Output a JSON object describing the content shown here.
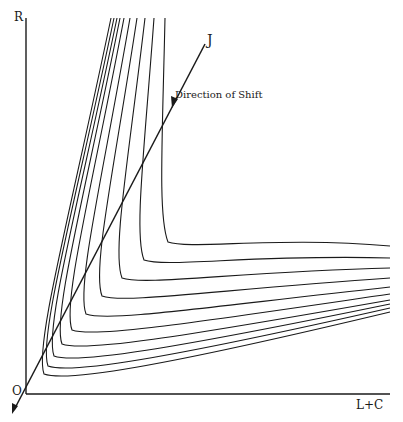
{
  "diagram": {
    "axes": {
      "y_label": "R",
      "x_label": "L+C",
      "origin_label": "O"
    },
    "line": {
      "label": "J",
      "annotation": "Direction of Shift"
    },
    "colors": {
      "ink": "#1a1a1a",
      "background": "#ffffff"
    },
    "curves": [
      {
        "top_x": 111,
        "vertex_x": 36,
        "vertex_y": 378,
        "right_y": 312
      },
      {
        "top_x": 114,
        "vertex_x": 40,
        "vertex_y": 370,
        "right_y": 308
      },
      {
        "top_x": 117,
        "vertex_x": 46,
        "vertex_y": 360,
        "right_y": 304
      },
      {
        "top_x": 120,
        "vertex_x": 54,
        "vertex_y": 348,
        "right_y": 300
      },
      {
        "top_x": 124,
        "vertex_x": 64,
        "vertex_y": 334,
        "right_y": 294
      },
      {
        "top_x": 130,
        "vertex_x": 78,
        "vertex_y": 318,
        "right_y": 287
      },
      {
        "top_x": 137,
        "vertex_x": 94,
        "vertex_y": 300,
        "right_y": 278
      },
      {
        "top_x": 145,
        "vertex_x": 114,
        "vertex_y": 282,
        "right_y": 268
      },
      {
        "top_x": 154,
        "vertex_x": 136,
        "vertex_y": 264,
        "right_y": 258
      },
      {
        "top_x": 165,
        "vertex_x": 160,
        "vertex_y": 246,
        "right_y": 246
      }
    ]
  }
}
